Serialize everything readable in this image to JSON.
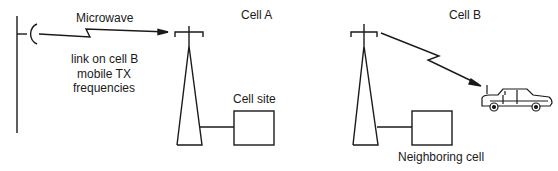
{
  "diagram": {
    "labels": {
      "microwave": "Microwave",
      "link_line1": "link on cell B",
      "link_line2": "mobile TX",
      "link_line3": "frequencies",
      "cell_a": "Cell A",
      "cell_b": "Cell B",
      "cell_site": "Cell site",
      "neighboring_cell": "Neighboring cell"
    },
    "colors": {
      "stroke": "#1a1a1a",
      "background": "#ffffff"
    }
  }
}
